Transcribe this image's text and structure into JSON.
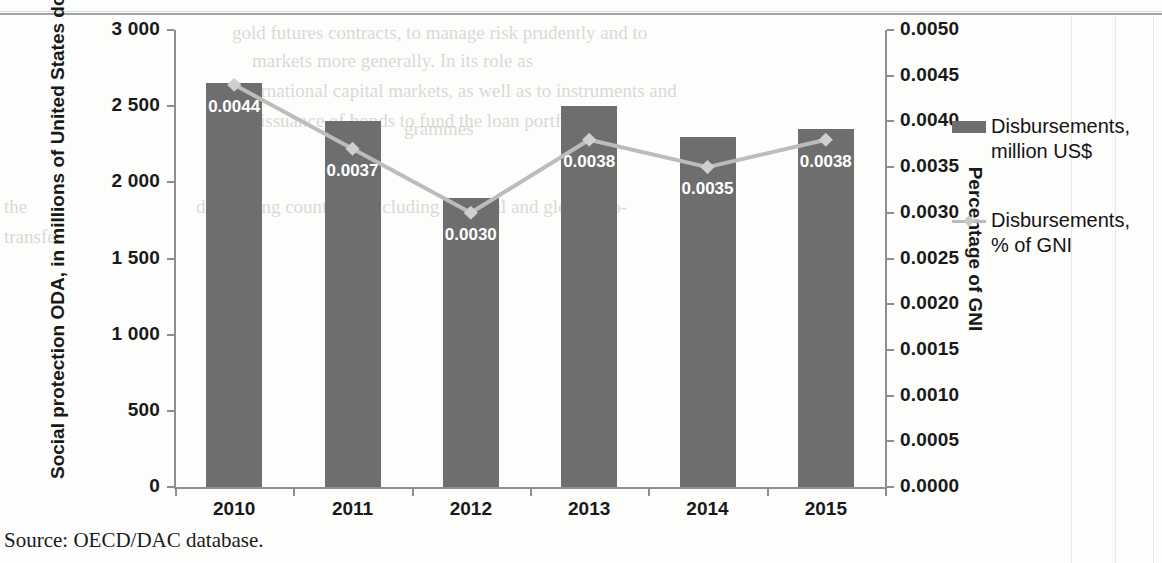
{
  "chart_data": {
    "type": "bar",
    "title": "",
    "categories": [
      "2010",
      "2011",
      "2012",
      "2013",
      "2014",
      "2015"
    ],
    "series": [
      {
        "name": "Disbursements, million US$",
        "type": "bar",
        "axis": "left",
        "color": "#6e6e6e",
        "values": [
          2650,
          2400,
          1900,
          2500,
          2300,
          2350
        ]
      },
      {
        "name": "Disbursements, % of GNI",
        "type": "line",
        "axis": "right",
        "color": "#bcbcbc",
        "values": [
          0.0044,
          0.0037,
          0.003,
          0.0038,
          0.0035,
          0.0038
        ],
        "point_labels": [
          "0.0044",
          "0.0037",
          "0.0030",
          "0.0038",
          "0.0035",
          "0.0038"
        ]
      }
    ],
    "xlabel": "",
    "ylabel": "Social protection ODA, in millions of United States dollars",
    "y2label": "Percentage of GNI",
    "ylim": [
      0,
      3000
    ],
    "y2lim": [
      0.0,
      0.005
    ],
    "yticks": [
      "0",
      "500",
      "1 000",
      "1 500",
      "2 000",
      "2 500",
      "3 000"
    ],
    "ytick_values": [
      0,
      500,
      1000,
      1500,
      2000,
      2500,
      3000
    ],
    "y2ticks": [
      "0.0000",
      "0.0005",
      "0.0010",
      "0.0015",
      "0.0020",
      "0.0025",
      "0.0030",
      "0.0035",
      "0.0040",
      "0.0045",
      "0.0050"
    ],
    "y2tick_values": [
      0.0,
      0.0005,
      0.001,
      0.0015,
      0.002,
      0.0025,
      0.003,
      0.0035,
      0.004,
      0.0045,
      0.005
    ],
    "grid": false,
    "legend_position": "right"
  },
  "axes": {
    "left_title": "Social protection ODA, in millions of United States dollars",
    "right_title": "Percentage of GNI"
  },
  "legend": {
    "entries": [
      {
        "label": "Disbursements,\nmillion US$",
        "marker": "bar-swatch"
      },
      {
        "label": "Disbursements,\n% of GNI",
        "marker": "line-diamond-swatch"
      }
    ]
  },
  "source": {
    "text": "Source: OECD/DAC database."
  },
  "bleed_text": {
    "l1": "gold futures contracts, to manage risk prudently and to",
    "l2": "markets more generally. In its role as",
    "l3": "international capital markets, as well as to instruments and",
    "l4": "the issuance of bonds to fund the loan portfolio.",
    "r1": "the",
    "r2": "transfer",
    "r3": "developing countries, excluding regional and global pro-",
    "r4": "grammes"
  }
}
